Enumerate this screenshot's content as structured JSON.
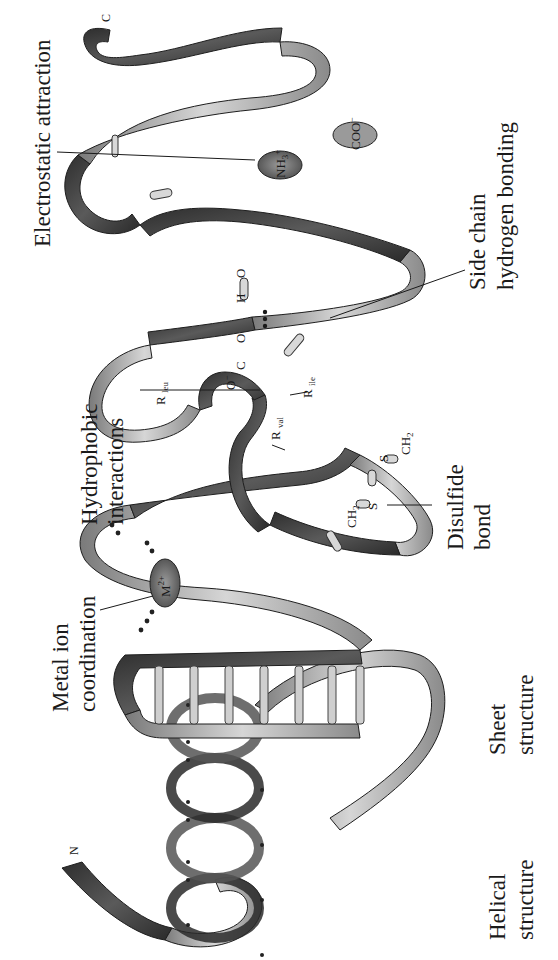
{
  "diagram": {
    "orientation": "rotated 90° counter-clockwise",
    "terminals": {
      "n": "N",
      "c": "C"
    },
    "labels": {
      "helical": [
        "Helical",
        "structure"
      ],
      "sheet": [
        "Sheet",
        "structure"
      ],
      "metal": [
        "Metal ion",
        "coordination"
      ],
      "hydrophobic": [
        "Hydrophobic",
        "interactions"
      ],
      "disulfide": [
        "Disulfide",
        "bond"
      ],
      "sidechain": [
        "Side chain",
        "hydrogen bonding"
      ],
      "electrostatic": [
        "Electrostatic attraction"
      ]
    },
    "chemistry": {
      "metal_ion": "M",
      "metal_charge": "2+",
      "r_leu": "R",
      "r_leu_sub": "leu",
      "r_val": "R",
      "r_val_sub": "val",
      "r_ile": "R",
      "r_ile_sub": "ile",
      "ch2_a": "CH",
      "ch2_a_sub": "2",
      "ch2_b": "CH",
      "ch2_b_sub": "2",
      "s_a": "S",
      "s_b": "S",
      "hbond_o_minus": "O",
      "hbond_o_minus_charge": "−",
      "hbond_c": "C",
      "hbond_o": "O",
      "hbond_h": "H",
      "hbond_o2": "O",
      "nh3": "NH",
      "nh3_sub": "3",
      "nh3_charge": "+",
      "coo": "COO",
      "coo_charge": "−"
    },
    "colors": {
      "ribbon_dark": "#3a3a3a",
      "ribbon_mid": "#8a8a8a",
      "ribbon_light": "#d0d0d0",
      "ion_fill": "#6e6e6e",
      "stick_fill": "#d8d8d8",
      "text": "#1a1a1a"
    }
  }
}
